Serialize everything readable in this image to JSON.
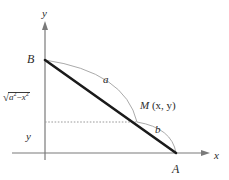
{
  "figure": {
    "type": "geometry-diagram",
    "axes": {
      "x_label": "x",
      "y_label": "y",
      "origin_label": ""
    },
    "points": [
      {
        "name": "B",
        "label": "B",
        "x": 45,
        "y": 60
      },
      {
        "name": "M",
        "label_var": "M",
        "label_coords": "(x, y)",
        "x": 137,
        "y": 122
      },
      {
        "name": "A",
        "label": "A",
        "x": 176,
        "y": 153
      }
    ],
    "segments": [
      {
        "name": "ladder",
        "from": "B",
        "to": "A",
        "style": "thick-solid"
      }
    ],
    "arcs": [
      {
        "name": "arc-a",
        "label": "a",
        "from": "B",
        "to": "M",
        "style": "thin-solid"
      },
      {
        "name": "arc-b",
        "label": "b",
        "from": "M",
        "to": "A",
        "style": "thin-solid"
      }
    ],
    "guides": [
      {
        "name": "height-guide",
        "style": "dotted",
        "from_x": 45,
        "to_x": 137,
        "y": 122
      }
    ],
    "labels": {
      "sqrt_radicand": "a",
      "sqrt_exponent_1": "2",
      "sqrt_minus": "−",
      "sqrt_var_2": "x",
      "sqrt_exponent_2": "2",
      "side_y": "y",
      "arc_a": "a",
      "arc_b": "b",
      "point_b": "B",
      "point_a": "A",
      "point_m_var": "M",
      "point_m_coords": "(x, y)"
    },
    "colors": {
      "axis": "#7a7a7a",
      "segment": "#1a1a1a",
      "arc": "#9a9a9a",
      "guide": "#9a9a9a",
      "text": "#2b2b2b",
      "background": "#ffffff"
    }
  }
}
